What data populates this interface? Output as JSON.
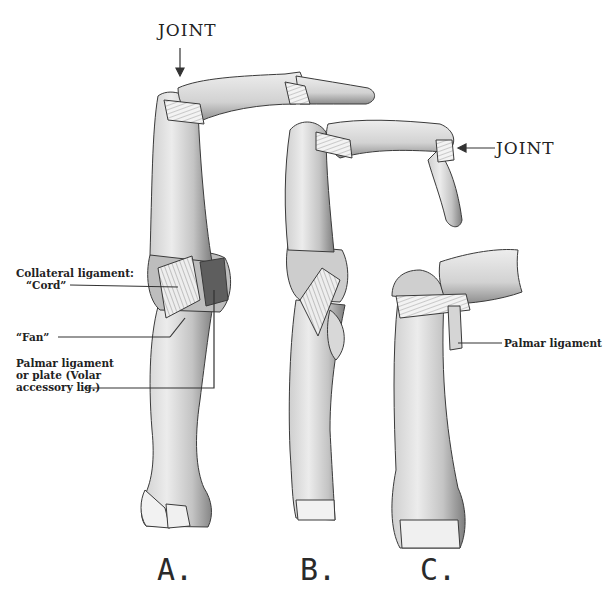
{
  "figure": {
    "panels": [
      {
        "id": "A",
        "label": "A."
      },
      {
        "id": "B",
        "label": "B."
      },
      {
        "id": "C",
        "label": "C."
      }
    ],
    "annotations": {
      "joint_top": "JOINT",
      "joint_right": "JOINT",
      "collateral_line1": "Collateral ligament:",
      "collateral_line2": "“Cord”",
      "fan": "“Fan”",
      "palmar_plate_line1": "Palmar ligament",
      "palmar_plate_line2": "or plate (Volar",
      "palmar_plate_line3": "accessory lig.)",
      "palmar_ligament_c": "Palmar ligament"
    },
    "colors": {
      "bone_fill": "#e4e4e4",
      "bone_shade": "#9a9a9a",
      "outline": "#3a3a3a",
      "ligament": "#f2f2f2",
      "leader_line": "#333333"
    }
  }
}
